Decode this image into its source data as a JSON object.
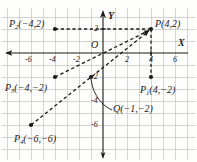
{
  "figure": {
    "type": "cartesian-coordinate-diagram",
    "background_color": "#fdfdfb",
    "grid_color": "#c9c9c9",
    "ink_color": "#1a1a1a",
    "unit_px": 12,
    "origin_px": {
      "x": 103,
      "y": 53
    }
  },
  "axes": {
    "x_label": "X",
    "y_label": "Y",
    "origin_label": "O",
    "x_ticks": [
      "-6",
      "-4",
      "-2",
      "2",
      "4",
      "6"
    ],
    "x_tick_values": [
      -6,
      -4,
      -2,
      2,
      4,
      6
    ],
    "y_ticks": [
      "2",
      "-2",
      "-4",
      "-6"
    ],
    "y_tick_values": [
      2,
      -2,
      -4,
      -6
    ],
    "x_range": [
      -8,
      7.5
    ],
    "y_range": [
      -8.5,
      4
    ]
  },
  "points": [
    {
      "name": "P",
      "label": "P(4,2)",
      "base": "P",
      "sub": "",
      "coords": "(4,2)",
      "x": 4,
      "y": 2
    },
    {
      "name": "P1",
      "label": "P1(4,-2)",
      "base": "P",
      "sub": "1",
      "coords": "(4,−2)",
      "x": 4,
      "y": -2
    },
    {
      "name": "P2",
      "label": "P2(-4,2)",
      "base": "P",
      "sub": "2",
      "coords": "(−4,2)",
      "x": -4,
      "y": 2
    },
    {
      "name": "P3",
      "label": "P3(-4,-2)",
      "base": "P",
      "sub": "3",
      "coords": "(−4,−2)",
      "x": -4,
      "y": -2
    },
    {
      "name": "P4",
      "label": "P4(-6,-6)",
      "base": "P",
      "sub": "4",
      "coords": "(−6,−6)",
      "x": -6,
      "y": -6
    },
    {
      "name": "Q",
      "label": "Q(-1,-2)",
      "base": "Q",
      "sub": "",
      "coords": "(−1,−2)",
      "x": -1,
      "y": -2
    }
  ],
  "labels": {
    "P": {
      "base": "P",
      "sub": "",
      "coords": "(4,2)"
    },
    "P1": {
      "base": "P",
      "sub": "1",
      "coords": "(4,−2)"
    },
    "P2": {
      "base": "P",
      "sub": "2",
      "coords": "(−4,2)"
    },
    "P3": {
      "base": "P",
      "sub": "3",
      "coords": "(−4,−2)"
    },
    "P4": {
      "base": "P",
      "sub": "4",
      "coords": "(−6,−6)"
    },
    "Q": {
      "base": "Q",
      "sub": "",
      "coords": "(−1,−2)"
    }
  },
  "segments": [
    {
      "name": "P2-to-P",
      "from": "P2",
      "to": "P",
      "style": "dashed",
      "arrow": "none"
    },
    {
      "name": "P-to-P1",
      "from": "P",
      "to": "P1",
      "style": "dashed",
      "arrow": "none"
    },
    {
      "name": "P3-to-P",
      "from": "P3",
      "to": "P",
      "style": "dashed",
      "arrow": "end"
    },
    {
      "name": "P4-to-P",
      "from": "P4",
      "to": "P",
      "style": "dashed",
      "arrow": "end"
    }
  ],
  "leader": {
    "name": "q-leader",
    "from_label": "Q",
    "to_point": "Q",
    "style": "curved-solid"
  }
}
